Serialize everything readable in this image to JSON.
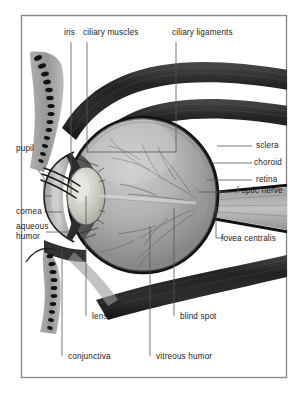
{
  "figure": {
    "style": "grayscale cross-section illustration",
    "frame_color": "#8a8a8a",
    "background_color": "#ffffff",
    "text_color": "#1b1b1b",
    "leader_line_color": "#555555"
  },
  "labels": {
    "top": [
      {
        "id": "iris",
        "text": "iris"
      },
      {
        "id": "ciliary-muscles",
        "text": "ciliary muscles"
      },
      {
        "id": "ciliary-ligaments",
        "text": "ciliary ligaments"
      }
    ],
    "left": [
      {
        "id": "pupil",
        "text": "pupil"
      },
      {
        "id": "cornea",
        "text": "cornea"
      },
      {
        "id": "aqueous-humor-line1",
        "text": "aqueous"
      },
      {
        "id": "aqueous-humor-line2",
        "text": "humor"
      }
    ],
    "right": [
      {
        "id": "sclera",
        "text": "sclera"
      },
      {
        "id": "choroid",
        "text": "choroid"
      },
      {
        "id": "retina",
        "text": "retina"
      },
      {
        "id": "optic-nerve",
        "text": "optic nerve"
      },
      {
        "id": "fovea-centralis",
        "text": "fovea centralis"
      }
    ],
    "bottom": [
      {
        "id": "lens",
        "text": "lens"
      },
      {
        "id": "conjunctiva",
        "text": "conjunctiva"
      },
      {
        "id": "blind-spot",
        "text": "blind spot"
      },
      {
        "id": "vitreous-humor",
        "text": "vitreous humor"
      }
    ]
  },
  "structures": [
    {
      "id": "upper-eyelid",
      "name": "upper eyelid with eyelashes"
    },
    {
      "id": "lower-eyelid",
      "name": "lower eyelid with eyelashes"
    },
    {
      "id": "superior-rectus-muscle",
      "name": "upper extraocular muscle band"
    },
    {
      "id": "superior-oblique-muscle",
      "name": "second upper extraocular muscle band"
    },
    {
      "id": "inferior-rectus-muscle",
      "name": "lower extraocular muscle band"
    },
    {
      "id": "eyeball",
      "name": "eyeball globe"
    },
    {
      "id": "cornea-dome",
      "name": "cornea"
    },
    {
      "id": "lens-body",
      "name": "crystalline lens"
    },
    {
      "id": "ciliary-body",
      "name": "ciliary body"
    },
    {
      "id": "retinal-vessels",
      "name": "retinal blood vessels"
    },
    {
      "id": "optic-nerve-trunk",
      "name": "optic nerve trunk"
    }
  ]
}
